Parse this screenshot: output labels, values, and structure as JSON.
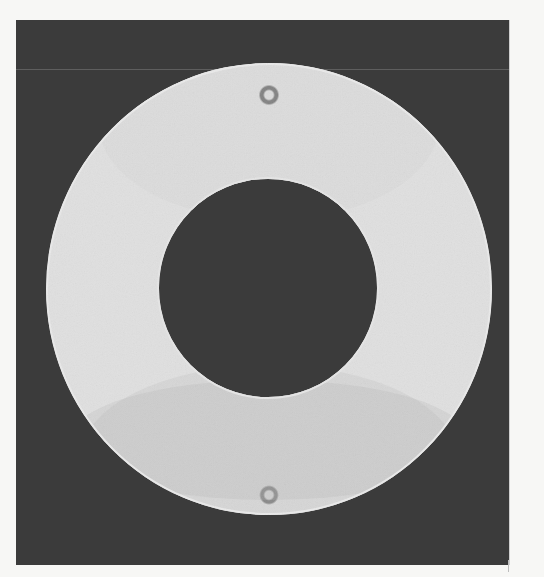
{
  "image": {
    "subject": "photoelastic fringe pattern of an annular disc (ring)",
    "background_color": "#3b3b3b",
    "page_color": "#f7f7f5",
    "fringe_light": "#d9d9d9",
    "fringe_dark": "#8a8a8a",
    "ring": {
      "outer_center": [
        269,
        289
      ],
      "outer_radius": [
        223,
        226
      ],
      "inner_center": [
        268,
        288
      ],
      "inner_radius": 109
    }
  }
}
